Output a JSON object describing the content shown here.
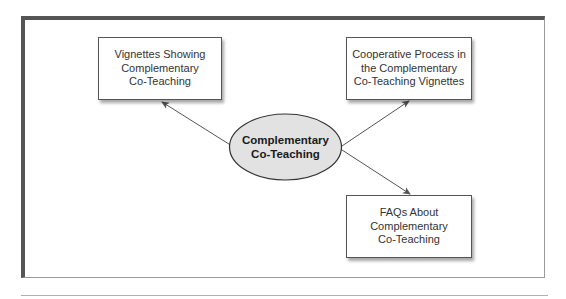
{
  "diagram": {
    "type": "concept-map",
    "center": {
      "label": "Complementary\nCo-Teaching",
      "shape": "ellipse",
      "fill": "#e2e2e2",
      "stroke": "#333333"
    },
    "nodes": [
      {
        "id": "vignettes",
        "label": "Vignettes Showing\nComplementary\nCo-Teaching",
        "position": "top-left"
      },
      {
        "id": "cooperative-process",
        "label": "Cooperative Process in\nthe Complementary\nCo-Teaching Vignettes",
        "position": "top-right"
      },
      {
        "id": "faqs",
        "label": "FAQs About\nComplementary\nCo-Teaching",
        "position": "bottom-right"
      }
    ],
    "edges": [
      {
        "from": "center",
        "to": "vignettes"
      },
      {
        "from": "center",
        "to": "cooperative-process"
      },
      {
        "from": "center",
        "to": "faqs"
      }
    ],
    "colors": {
      "frame_dark": "#555555",
      "frame_light": "#9a9a9a",
      "arrow": "#555555",
      "text": "#333333"
    }
  }
}
